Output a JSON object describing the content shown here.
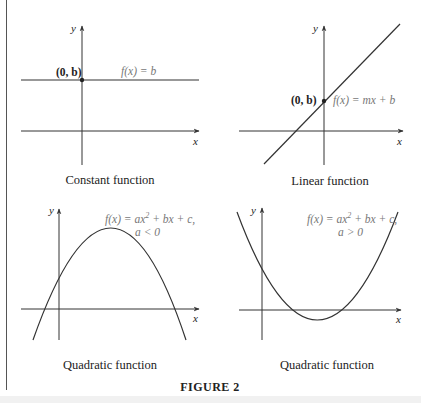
{
  "figure": {
    "label": "FIGURE 2",
    "panels": [
      {
        "caption": "Constant function",
        "point_label": "(0, b)",
        "equation": "f(x) = b",
        "x_axis_label": "x",
        "y_axis_label": "y"
      },
      {
        "caption": "Linear function",
        "point_label": "(0, b)",
        "equation": "f(x) = mx + b",
        "x_axis_label": "x",
        "y_axis_label": "y"
      },
      {
        "caption": "Quadratic function",
        "equation_main": "f(x) = ax",
        "equation_exp": "2",
        "equation_rest": " + bx + c,",
        "condition": "a < 0",
        "x_axis_label": "x",
        "y_axis_label": "y"
      },
      {
        "caption": "Quadratic function",
        "equation_main": "f(x) = ax",
        "equation_exp": "2",
        "equation_rest": " + bx + c,",
        "condition": "a > 0",
        "x_axis_label": "x",
        "y_axis_label": "y"
      }
    ]
  },
  "colors": {
    "line": "#333333",
    "equation_text": "#777777",
    "bottom_band": "#f1f1f1"
  }
}
